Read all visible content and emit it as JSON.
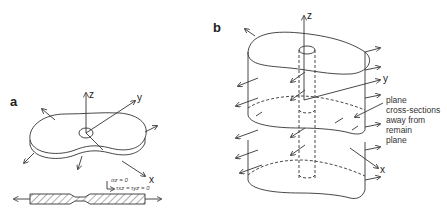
{
  "panel_a": {
    "label": "a",
    "axes": {
      "z": "z",
      "y": "y",
      "x": "x"
    },
    "eq1": "σz = 0",
    "eq2": "τxz = τyz = 0"
  },
  "panel_b": {
    "label": "b",
    "axes": {
      "z": "z",
      "y": "y",
      "x": "x"
    },
    "annotation": [
      "plane",
      "cross-sections",
      "away from",
      "remain",
      "plane"
    ]
  },
  "colors": {
    "stroke": "#333333",
    "background": "#ffffff"
  }
}
